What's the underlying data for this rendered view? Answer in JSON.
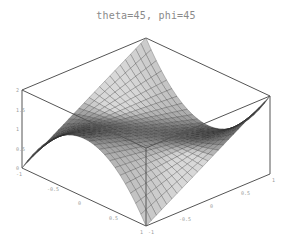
{
  "chart_data": {
    "type": "surface3d",
    "title": "theta=45, phi=45",
    "view": {
      "theta": 45,
      "phi": 45
    },
    "x": {
      "label": "",
      "range": [
        -1,
        1
      ],
      "ticks": [
        "-1",
        "-0.5",
        "0",
        "0.5",
        "1"
      ]
    },
    "y": {
      "label": "",
      "range": [
        -1,
        1
      ],
      "ticks": [
        "-1",
        "-0.5",
        "0",
        "0.5",
        "1"
      ]
    },
    "z": {
      "label": "",
      "range": [
        0,
        2
      ],
      "ticks": [
        "0",
        "0.5",
        "1",
        "1.5",
        "2"
      ]
    },
    "surface": {
      "description": "saddle surface; corners left & front at z=0, back & right at z=2; center z=1",
      "grid": 24,
      "bulge": 1.5
    },
    "grid": false,
    "box": true
  },
  "colors": {
    "box": "#555555",
    "mesh": "#2b2b2b",
    "surface_dark": "#4a4a4a",
    "surface_light": "#d8d8d8",
    "tick_label": "#9a9a9a",
    "title": "#8a8a8a"
  },
  "projection": {
    "left_bottom": [
      22,
      168
    ],
    "front_bottom": [
      146,
      226
    ],
    "back_bottom": [
      146,
      116
    ],
    "right_bottom": [
      270,
      174
    ],
    "z_pixels_per_unit": 39
  }
}
